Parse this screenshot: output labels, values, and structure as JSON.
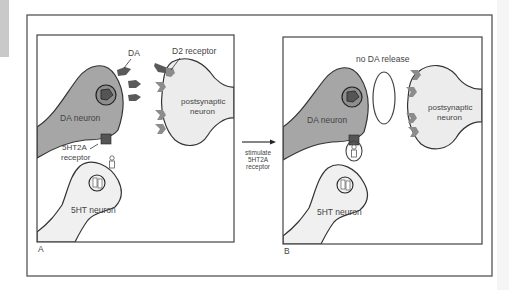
{
  "figure": {
    "panel_a": {
      "letter": "A",
      "labels": {
        "da": "DA",
        "d2_receptor": "D2 receptor",
        "da_neuron": "DA neuron",
        "postsynaptic_line1": "postsynaptic",
        "postsynaptic_line2": "neuron",
        "receptor_5ht2a_line1": "5HT2A",
        "receptor_5ht2a_line2": "receptor",
        "ht_neuron": "5HT neuron"
      }
    },
    "transition": {
      "line1": "stimulate",
      "line2": "5HT2A",
      "line3": "receptor"
    },
    "panel_b": {
      "letter": "B",
      "labels": {
        "no_release": "no DA release",
        "da_neuron": "DA neuron",
        "postsynaptic_line1": "postsynaptic",
        "postsynaptic_line2": "neuron",
        "ht_neuron": "5HT neuron"
      }
    },
    "colors": {
      "da_neuron_fill": "#a6a6a6",
      "postsynaptic_fill": "#ececec",
      "ht_neuron_fill": "#f0f0f0",
      "dark_molecule": "#5a5a5a",
      "outline": "#333333",
      "receptor_fill": "#8c8c8c"
    }
  }
}
